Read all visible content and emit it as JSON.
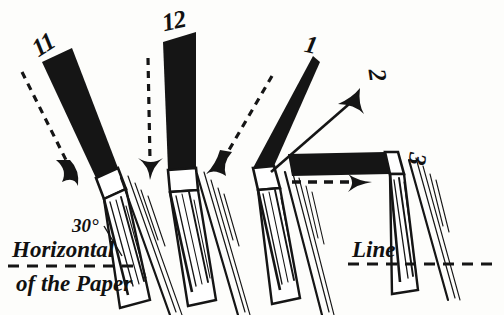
{
  "figure": {
    "type": "calligraphy-pen-angle-illustration",
    "background_color": "#fdfdfb",
    "ink_color": "#111111"
  },
  "clock_labels": [
    {
      "id": "eleven",
      "text": "11",
      "x": 32,
      "y": 32,
      "rotation": -32
    },
    {
      "id": "twelve",
      "text": "12",
      "x": 162,
      "y": 8,
      "rotation": -12
    },
    {
      "id": "one",
      "text": "1",
      "x": 305,
      "y": 32,
      "rotation": 12
    },
    {
      "id": "two",
      "text": "2",
      "x": 372,
      "y": 62,
      "rotation": 82
    },
    {
      "id": "three",
      "text": "3",
      "x": 412,
      "y": 146,
      "rotation": 96
    }
  ],
  "annotations": [
    {
      "id": "angle",
      "text": "30°",
      "x": 72,
      "y": 216
    },
    {
      "id": "horizontal",
      "text": "Horizontal",
      "x": 12,
      "y": 238
    },
    {
      "id": "of-paper",
      "text": "of the Paper",
      "x": 16,
      "y": 272
    },
    {
      "id": "line",
      "text": "Line",
      "x": 352,
      "y": 238
    }
  ],
  "pens": [
    {
      "id": "pen-11",
      "label": "11",
      "body_angle_deg": -56,
      "nib_x": 100,
      "nib_y": 176,
      "arrow": "dashed",
      "description": "pen held toward 11 o'clock"
    },
    {
      "id": "pen-12",
      "label": "12",
      "body_angle_deg": -85,
      "nib_x": 183,
      "nib_y": 172,
      "arrow": "dashed",
      "description": "pen held toward 12 o'clock"
    },
    {
      "id": "pen-1",
      "label": "1",
      "body_angle_deg": -68,
      "nib_x": 268,
      "nib_y": 170,
      "arrow": "dashed",
      "description": "pen held toward 1 o'clock"
    },
    {
      "id": "pen-2",
      "label": "2",
      "body_angle_deg": -30,
      "nib_x": 268,
      "nib_y": 170,
      "arrow": "solid",
      "description": "direction arrow toward 2 o'clock"
    },
    {
      "id": "pen-3",
      "label": "3",
      "body_angle_deg": 0,
      "nib_x": 378,
      "nib_y": 168,
      "arrow": "dashed",
      "description": "pen held toward 3 o'clock, horizontal"
    }
  ],
  "reference_lines": [
    {
      "id": "horizontal-left",
      "style": "dashed",
      "x1": 8,
      "y1": 266,
      "x2": 140,
      "y2": 266
    },
    {
      "id": "horizontal-right",
      "style": "dashed",
      "x1": 348,
      "y1": 264,
      "x2": 500,
      "y2": 264
    }
  ]
}
